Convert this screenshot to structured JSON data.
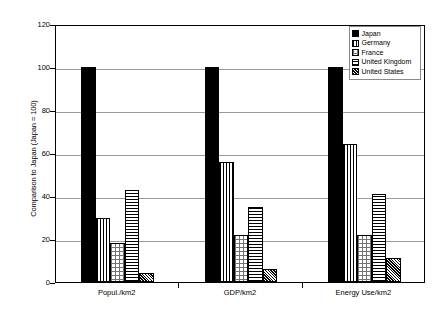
{
  "chart_data": {
    "type": "bar",
    "title": "",
    "subtitle": "",
    "xlabel": "",
    "ylabel": "Comparison to Japan (Japan = 100)",
    "ylim": [
      0,
      120
    ],
    "ytick_values": [
      0,
      20,
      40,
      60,
      80,
      100,
      120
    ],
    "ytick_labels": [
      "0",
      "20",
      "40",
      "60",
      "80",
      "100",
      "120"
    ],
    "grid": true,
    "grid_axis": "y",
    "legend_position": "top-right",
    "categories": [
      "Popul./km2",
      "GDP/km2",
      "Energy Use/km2"
    ],
    "series": [
      {
        "name": "Japan",
        "pattern": "solid",
        "values": [
          100,
          100,
          100
        ]
      },
      {
        "name": "Germany",
        "pattern": "vertical",
        "values": [
          30,
          56,
          64
        ]
      },
      {
        "name": "France",
        "pattern": "dots",
        "values": [
          18,
          22,
          22
        ]
      },
      {
        "name": "United Kingdom",
        "pattern": "horizontal",
        "values": [
          43,
          35,
          41
        ]
      },
      {
        "name": "United States",
        "pattern": "cross",
        "values": [
          4,
          6,
          11
        ]
      }
    ]
  },
  "legend": {
    "entries": [
      {
        "label": "Japan"
      },
      {
        "label": "Germany"
      },
      {
        "label": "France"
      },
      {
        "label": "United Kingdom"
      },
      {
        "label": "United States"
      }
    ]
  }
}
